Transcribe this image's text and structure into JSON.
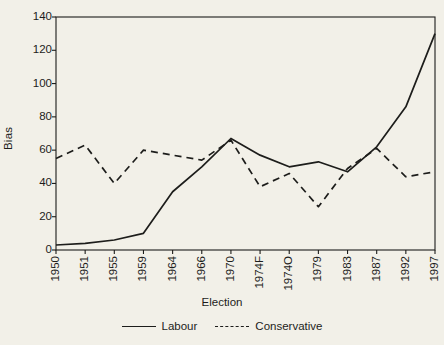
{
  "chart_data": {
    "type": "line",
    "title": "",
    "xlabel": "Election",
    "ylabel": "Bias",
    "categories": [
      "1950",
      "1951",
      "1955",
      "1959",
      "1964",
      "1966",
      "1970",
      "1974F",
      "1974O",
      "1979",
      "1983",
      "1987",
      "1992",
      "1997"
    ],
    "ylim": [
      0,
      140
    ],
    "yticks": [
      0,
      20,
      40,
      60,
      80,
      100,
      120,
      140
    ],
    "grid": false,
    "legend_position": "bottom-center",
    "series": [
      {
        "name": "Labour",
        "style": "solid",
        "color": "#1d1d1b",
        "values": [
          3,
          4,
          6,
          10,
          35,
          50,
          67,
          57,
          50,
          53,
          47,
          62,
          86,
          130
        ]
      },
      {
        "name": "Conservative",
        "style": "dashed",
        "color": "#1d1d1b",
        "values": [
          55,
          63,
          40,
          60,
          57,
          54,
          66,
          38,
          46,
          26,
          49,
          61,
          44,
          47
        ]
      }
    ]
  },
  "axes": {
    "y_tick_labels": [
      "140",
      "120",
      "100",
      "80",
      "60",
      "40",
      "20",
      "0"
    ],
    "y_title": "Bias",
    "x_title": "Election"
  },
  "legend": {
    "entries": [
      {
        "label": "Labour",
        "style": "solid"
      },
      {
        "label": "Conservative",
        "style": "dashed"
      }
    ]
  }
}
